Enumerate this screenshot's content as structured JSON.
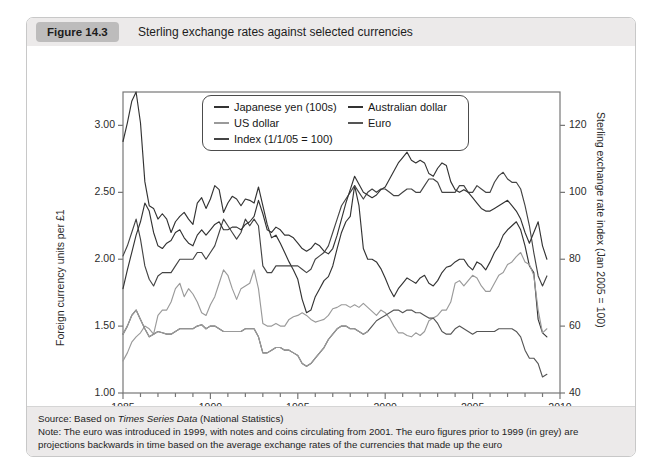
{
  "figure": {
    "badge": "Figure 14.3",
    "title": "Sterling exchange rates against selected currencies"
  },
  "footer": {
    "source_prefix": "Source: Based on ",
    "source_italic": "Times Series Data",
    "source_suffix": " (National Statistics)",
    "note": "Note: The euro was introduced in 1999, with notes and coins circulating from 2001. The euro figures prior to 1999 (in grey) are projections backwards in time based on the average exchange rates of the currencies that made up the euro"
  },
  "colors": {
    "dark_line": "#333333",
    "mid_line": "#555555",
    "grey_line": "#9a9a9a",
    "header_bg": "#eceaea",
    "badge_bg": "#bdbcbc",
    "frame": "#777777"
  },
  "chart_data": {
    "type": "line",
    "title": "Sterling exchange rates against selected currencies",
    "xlabel": "",
    "ylabel": "Foreign currency units per £1",
    "ylabel_right": "Sterling exchange rate index (Jan 2005 = 100)",
    "xlim": [
      1985,
      2010
    ],
    "ylim": [
      1.0,
      3.25
    ],
    "ylim_right": [
      40,
      130
    ],
    "yticks": [
      1.0,
      1.5,
      2.0,
      2.5,
      3.0
    ],
    "ytick_labels": [
      "1.00",
      "1.50",
      "2.00",
      "2.50",
      "3.00"
    ],
    "yticks_right": [
      40,
      60,
      80,
      100,
      120
    ],
    "ytick_labels_right": [
      "40",
      "60",
      "80",
      "100",
      "120"
    ],
    "xticks": [
      1985,
      1990,
      1995,
      2000,
      2005,
      2010
    ],
    "xtick_labels": [
      "1985",
      "1990",
      "1995",
      "2000",
      "2005",
      "2010"
    ],
    "xminor_step": 1,
    "grid": false,
    "legend_position": "upper-center",
    "legend": [
      {
        "label": "Japanese yen (100s)",
        "color": "#333333"
      },
      {
        "label": "US dollar",
        "color": "#9a9a9a"
      },
      {
        "label": "Index (1/1/05 = 100)",
        "color": "#444444"
      },
      {
        "label": "Australian dollar",
        "color": "#333333"
      },
      {
        "label": "Euro",
        "color": "#555555"
      }
    ],
    "x": [
      1985.0,
      1985.25,
      1985.5,
      1985.75,
      1986.0,
      1986.25,
      1986.5,
      1986.75,
      1987.0,
      1987.25,
      1987.5,
      1987.75,
      1988.0,
      1988.25,
      1988.5,
      1988.75,
      1989.0,
      1989.25,
      1989.5,
      1989.75,
      1990.0,
      1990.25,
      1990.5,
      1990.75,
      1991.0,
      1991.25,
      1991.5,
      1991.75,
      1992.0,
      1992.25,
      1992.5,
      1992.75,
      1993.0,
      1993.25,
      1993.5,
      1993.75,
      1994.0,
      1994.25,
      1994.5,
      1994.75,
      1995.0,
      1995.25,
      1995.5,
      1995.75,
      1996.0,
      1996.25,
      1996.5,
      1996.75,
      1997.0,
      1997.25,
      1997.5,
      1997.75,
      1998.0,
      1998.25,
      1998.5,
      1998.75,
      1999.0,
      1999.25,
      1999.5,
      1999.75,
      2000.0,
      2000.25,
      2000.5,
      2000.75,
      2001.0,
      2001.25,
      2001.5,
      2001.75,
      2002.0,
      2002.25,
      2002.5,
      2002.75,
      2003.0,
      2003.25,
      2003.5,
      2003.75,
      2004.0,
      2004.25,
      2004.5,
      2004.75,
      2005.0,
      2005.25,
      2005.5,
      2005.75,
      2006.0,
      2006.25,
      2006.5,
      2006.75,
      2007.0,
      2007.25,
      2007.5,
      2007.75,
      2008.0,
      2008.25,
      2008.5,
      2008.75,
      2009.0,
      2009.25
    ],
    "series": [
      {
        "name": "Japanese yen (100s)",
        "color": "#333333",
        "axis": "left",
        "values": [
          2.88,
          3.02,
          3.18,
          3.25,
          3.02,
          2.58,
          2.4,
          2.38,
          2.3,
          2.34,
          2.3,
          2.2,
          2.28,
          2.32,
          2.35,
          2.3,
          2.26,
          2.42,
          2.46,
          2.38,
          2.45,
          2.55,
          2.52,
          2.35,
          2.42,
          2.47,
          2.45,
          2.4,
          2.45,
          2.44,
          2.42,
          2.54,
          2.4,
          2.26,
          2.16,
          2.18,
          2.12,
          2.05,
          1.98,
          1.92,
          1.85,
          1.7,
          1.6,
          1.62,
          1.72,
          1.78,
          1.84,
          1.87,
          1.95,
          2.08,
          2.2,
          2.28,
          2.32,
          2.55,
          2.4,
          2.08,
          2.0,
          2.0,
          1.98,
          1.93,
          1.86,
          1.78,
          1.72,
          1.78,
          1.82,
          1.86,
          1.84,
          1.82,
          1.86,
          1.88,
          1.82,
          1.8,
          1.84,
          1.9,
          1.94,
          1.95,
          1.98,
          2.0,
          2.0,
          1.95,
          1.92,
          1.98,
          1.96,
          1.92,
          1.98,
          2.05,
          2.1,
          2.18,
          2.22,
          2.25,
          2.28,
          2.22,
          2.1,
          1.95,
          1.9,
          1.55,
          1.45,
          1.42
        ]
      },
      {
        "name": "US dollar",
        "color": "#9a9a9a",
        "axis": "left",
        "values": [
          1.24,
          1.3,
          1.38,
          1.42,
          1.45,
          1.5,
          1.48,
          1.44,
          1.58,
          1.62,
          1.62,
          1.68,
          1.78,
          1.82,
          1.72,
          1.78,
          1.74,
          1.68,
          1.6,
          1.58,
          1.66,
          1.72,
          1.82,
          1.92,
          1.88,
          1.78,
          1.7,
          1.78,
          1.8,
          1.82,
          1.92,
          1.78,
          1.52,
          1.5,
          1.5,
          1.52,
          1.5,
          1.5,
          1.55,
          1.57,
          1.58,
          1.6,
          1.58,
          1.55,
          1.53,
          1.54,
          1.55,
          1.58,
          1.63,
          1.64,
          1.66,
          1.66,
          1.64,
          1.66,
          1.64,
          1.67,
          1.64,
          1.61,
          1.58,
          1.62,
          1.6,
          1.56,
          1.5,
          1.45,
          1.45,
          1.43,
          1.42,
          1.45,
          1.43,
          1.46,
          1.54,
          1.56,
          1.58,
          1.62,
          1.62,
          1.68,
          1.82,
          1.84,
          1.8,
          1.84,
          1.88,
          1.86,
          1.8,
          1.76,
          1.76,
          1.82,
          1.88,
          1.9,
          1.96,
          1.98,
          2.02,
          2.05,
          1.98,
          1.96,
          1.88,
          1.62,
          1.45,
          1.48
        ]
      },
      {
        "name": "Index (1/1/05 = 100)",
        "color": "#444444",
        "axis": "right",
        "values": [
          81,
          84,
          88,
          92,
          86,
          78,
          74,
          72,
          75,
          76,
          76,
          76,
          78,
          80,
          80,
          80,
          80,
          82,
          82,
          80,
          82,
          84,
          88,
          92,
          90,
          88,
          86,
          88,
          92,
          90,
          92,
          90,
          78,
          76,
          76,
          78,
          78,
          78,
          78,
          78,
          78,
          77,
          76,
          77,
          80,
          81,
          82,
          84,
          88,
          92,
          96,
          98,
          100,
          102,
          100,
          98,
          100,
          101,
          100,
          101,
          101,
          100,
          99,
          99,
          100,
          101,
          101,
          100,
          100,
          102,
          104,
          104,
          103,
          100,
          100,
          100,
          100,
          102,
          102,
          100,
          100,
          102,
          101,
          100,
          100,
          103,
          105,
          106,
          104,
          103,
          103,
          101,
          96,
          90,
          82,
          75,
          72,
          75
        ]
      },
      {
        "name": "Australian dollar",
        "color": "#333333",
        "axis": "left",
        "values": [
          1.78,
          1.92,
          2.05,
          2.18,
          2.28,
          2.42,
          2.36,
          2.2,
          2.1,
          2.08,
          2.12,
          2.14,
          2.2,
          2.22,
          2.16,
          2.12,
          2.1,
          2.18,
          2.22,
          2.18,
          2.22,
          2.26,
          2.28,
          2.22,
          2.22,
          2.24,
          2.24,
          2.22,
          2.26,
          2.28,
          2.32,
          2.44,
          2.34,
          2.22,
          2.2,
          2.24,
          2.22,
          2.18,
          2.18,
          2.16,
          2.12,
          2.08,
          2.06,
          2.08,
          2.12,
          2.1,
          2.06,
          2.04,
          2.08,
          2.18,
          2.3,
          2.42,
          2.52,
          2.62,
          2.56,
          2.5,
          2.48,
          2.46,
          2.48,
          2.52,
          2.54,
          2.6,
          2.66,
          2.72,
          2.76,
          2.8,
          2.74,
          2.72,
          2.74,
          2.72,
          2.64,
          2.62,
          2.68,
          2.72,
          2.7,
          2.58,
          2.52,
          2.5,
          2.52,
          2.5,
          2.46,
          2.42,
          2.38,
          2.36,
          2.36,
          2.38,
          2.4,
          2.42,
          2.44,
          2.4,
          2.36,
          2.3,
          2.2,
          2.12,
          2.2,
          2.28,
          2.1,
          2.0
        ]
      },
      {
        "name": "Euro",
        "color": "#555555",
        "axis": "left",
        "values": [
          1.44,
          1.5,
          1.58,
          1.62,
          1.55,
          1.48,
          1.42,
          1.44,
          1.46,
          1.45,
          1.44,
          1.44,
          1.46,
          1.48,
          1.48,
          1.48,
          1.48,
          1.5,
          1.51,
          1.48,
          1.5,
          1.5,
          1.48,
          1.46,
          1.46,
          1.46,
          1.46,
          1.46,
          1.48,
          1.48,
          1.48,
          1.42,
          1.3,
          1.3,
          1.32,
          1.34,
          1.34,
          1.32,
          1.32,
          1.3,
          1.28,
          1.22,
          1.2,
          1.22,
          1.26,
          1.3,
          1.34,
          1.4,
          1.44,
          1.48,
          1.5,
          1.5,
          1.48,
          1.48,
          1.46,
          1.44,
          1.46,
          1.5,
          1.54,
          1.56,
          1.58,
          1.6,
          1.62,
          1.62,
          1.6,
          1.62,
          1.62,
          1.6,
          1.6,
          1.58,
          1.56,
          1.56,
          1.52,
          1.46,
          1.44,
          1.44,
          1.48,
          1.5,
          1.48,
          1.46,
          1.44,
          1.46,
          1.46,
          1.46,
          1.46,
          1.46,
          1.48,
          1.48,
          1.48,
          1.48,
          1.46,
          1.42,
          1.32,
          1.26,
          1.26,
          1.22,
          1.12,
          1.14
        ]
      }
    ]
  }
}
